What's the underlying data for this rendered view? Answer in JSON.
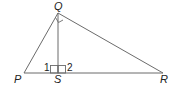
{
  "diagram": {
    "type": "geometry-triangle",
    "vertices": {
      "P": {
        "label": "P",
        "x": 24,
        "y": 73
      },
      "Q": {
        "label": "Q",
        "x": 58,
        "y": 13
      },
      "R": {
        "label": "R",
        "x": 163,
        "y": 73
      },
      "S": {
        "label": "S",
        "x": 58,
        "y": 73
      }
    },
    "angle_labels": {
      "one": "1",
      "two": "2"
    },
    "right_angles": [
      "Q",
      "S"
    ],
    "segments": [
      "PQ",
      "QR",
      "PR",
      "QS"
    ],
    "line_color": "#6b6b6b",
    "text_color": "#222222"
  }
}
